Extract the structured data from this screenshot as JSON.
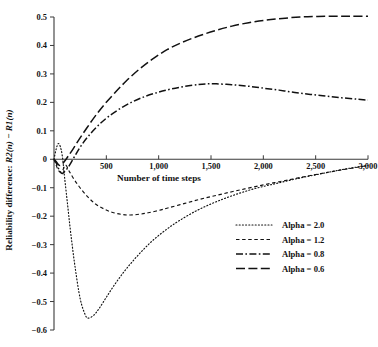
{
  "chart_data": {
    "type": "line",
    "title": "",
    "xlabel": "Number of time steps",
    "ylabel": "Reliability difference: R2(n) − R1(n)",
    "ylabel_parts": {
      "prefix": "Reliability difference: ",
      "term1": "R2(n)",
      "minus": " − ",
      "term2": "R1(n)"
    },
    "xlim": [
      0,
      3000
    ],
    "ylim": [
      -0.6,
      0.5
    ],
    "grid": false,
    "legend_position": "center-right",
    "xticks": [
      0,
      500,
      1000,
      1500,
      2000,
      2500,
      3000
    ],
    "xtick_labels": [
      "",
      "500",
      "1,000",
      "1,500",
      "2,000",
      "2,500",
      "3,000"
    ],
    "yticks": [
      0.5,
      0.4,
      0.3,
      0.2,
      0.1,
      0,
      -0.1,
      -0.2,
      -0.3,
      -0.4,
      -0.5,
      -0.6
    ],
    "ytick_labels": [
      "0.5",
      "0.4",
      "0.3",
      "0.2",
      "0.1",
      "0",
      "−0.1",
      "−0.2",
      "−0.3",
      "−0.4",
      "−0.5",
      "−0.6"
    ],
    "series": [
      {
        "name": "Alpha  =  2.0",
        "legend_label": "Alpha  =  2.0",
        "alpha": 2.0,
        "dash": "dotted",
        "color": "#111111",
        "x": [
          0,
          20,
          40,
          60,
          80,
          100,
          130,
          160,
          200,
          250,
          300,
          330,
          380,
          430,
          500,
          580,
          670,
          760,
          860,
          960,
          1080,
          1200,
          1350,
          1500,
          1650,
          1800,
          1950,
          2100,
          2250,
          2400,
          2550,
          2700,
          2850,
          3000
        ],
        "y": [
          0.0,
          0.035,
          0.055,
          0.045,
          0.01,
          -0.06,
          -0.16,
          -0.26,
          -0.375,
          -0.49,
          -0.548,
          -0.558,
          -0.548,
          -0.525,
          -0.485,
          -0.44,
          -0.395,
          -0.355,
          -0.315,
          -0.28,
          -0.245,
          -0.215,
          -0.183,
          -0.157,
          -0.135,
          -0.116,
          -0.1,
          -0.087,
          -0.074,
          -0.062,
          -0.051,
          -0.04,
          -0.03,
          -0.022
        ]
      },
      {
        "name": "Alpha  =  1.2",
        "legend_label": "Alpha  =  1.2",
        "alpha": 1.2,
        "dash": "dashed",
        "color": "#111111",
        "x": [
          0,
          20,
          40,
          60,
          80,
          110,
          150,
          200,
          260,
          330,
          400,
          480,
          560,
          650,
          730,
          820,
          900,
          1000,
          1100,
          1250,
          1400,
          1550,
          1700,
          1850,
          2000,
          2150,
          2300,
          2450,
          2600,
          2750,
          2900,
          3000
        ],
        "y": [
          0.0,
          -0.02,
          -0.038,
          -0.045,
          -0.042,
          -0.02,
          -0.045,
          -0.075,
          -0.105,
          -0.135,
          -0.158,
          -0.175,
          -0.187,
          -0.194,
          -0.196,
          -0.193,
          -0.188,
          -0.18,
          -0.17,
          -0.155,
          -0.14,
          -0.127,
          -0.114,
          -0.102,
          -0.09,
          -0.079,
          -0.068,
          -0.057,
          -0.047,
          -0.037,
          -0.028,
          -0.022
        ]
      },
      {
        "name": "Alpha  =  0.8",
        "legend_label": "Alpha  =  0.8",
        "alpha": 0.8,
        "dash": "dashdot",
        "color": "#111111",
        "x": [
          0,
          20,
          40,
          60,
          80,
          110,
          150,
          200,
          260,
          330,
          420,
          520,
          640,
          760,
          880,
          1000,
          1120,
          1250,
          1380,
          1450,
          1550,
          1700,
          1850,
          2000,
          2150,
          2300,
          2450,
          2600,
          2750,
          2900,
          3000
        ],
        "y": [
          0.0,
          -0.012,
          -0.03,
          -0.045,
          -0.05,
          -0.04,
          -0.02,
          0.012,
          0.048,
          0.082,
          0.118,
          0.15,
          0.18,
          0.204,
          0.222,
          0.236,
          0.247,
          0.256,
          0.263,
          0.265,
          0.265,
          0.262,
          0.257,
          0.25,
          0.243,
          0.235,
          0.228,
          0.222,
          0.216,
          0.211,
          0.208
        ]
      },
      {
        "name": "Alpha  =  0.6",
        "legend_label": "Alpha  =  0.6",
        "alpha": 0.6,
        "dash": "longdash",
        "color": "#111111",
        "x": [
          0,
          20,
          40,
          60,
          90,
          130,
          180,
          240,
          310,
          390,
          480,
          580,
          690,
          810,
          940,
          1080,
          1220,
          1380,
          1540,
          1700,
          1860,
          2020,
          2180,
          2350,
          2520,
          2700,
          2850,
          3000
        ],
        "y": [
          0.0,
          -0.008,
          -0.018,
          -0.022,
          -0.012,
          0.008,
          0.035,
          0.07,
          0.108,
          0.15,
          0.192,
          0.233,
          0.275,
          0.315,
          0.352,
          0.385,
          0.41,
          0.433,
          0.452,
          0.468,
          0.48,
          0.489,
          0.495,
          0.5,
          0.502,
          0.503,
          0.503,
          0.503
        ]
      }
    ]
  },
  "legend": {
    "entries": [
      {
        "label": "Alpha  =  2.0",
        "dash": "dotted"
      },
      {
        "label": "Alpha  =  1.2",
        "dash": "dashed"
      },
      {
        "label": "Alpha  =  0.8",
        "dash": "dashdot"
      },
      {
        "label": "Alpha  =  0.6",
        "dash": "longdash"
      }
    ]
  }
}
